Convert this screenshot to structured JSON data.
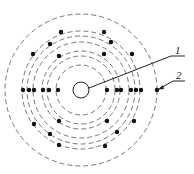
{
  "diagram": {
    "type": "atom-shell-model",
    "center": {
      "x": 81,
      "y": 90
    },
    "nucleus_radius": 8,
    "ring_radii": [
      25,
      34,
      39,
      48,
      54,
      59,
      76
    ],
    "electrons": [
      {
        "x": 23,
        "y": 90
      },
      {
        "x": 29,
        "y": 90
      },
      {
        "x": 34,
        "y": 90
      },
      {
        "x": 43,
        "y": 90
      },
      {
        "x": 49,
        "y": 90
      },
      {
        "x": 58,
        "y": 90
      },
      {
        "x": 107,
        "y": 90
      },
      {
        "x": 117,
        "y": 90
      },
      {
        "x": 121,
        "y": 90
      },
      {
        "x": 131,
        "y": 90
      },
      {
        "x": 136,
        "y": 90
      },
      {
        "x": 141,
        "y": 90
      },
      {
        "x": 157,
        "y": 90
      },
      {
        "x": 61,
        "y": 32
      },
      {
        "x": 104,
        "y": 32
      },
      {
        "x": 50,
        "y": 44
      },
      {
        "x": 111,
        "y": 42
      },
      {
        "x": 33,
        "y": 54
      },
      {
        "x": 59,
        "y": 56
      },
      {
        "x": 104,
        "y": 54
      },
      {
        "x": 132,
        "y": 54
      },
      {
        "x": 34,
        "y": 124
      },
      {
        "x": 59,
        "y": 121
      },
      {
        "x": 50,
        "y": 134
      },
      {
        "x": 59,
        "y": 145
      },
      {
        "x": 107,
        "y": 121
      },
      {
        "x": 134,
        "y": 121
      },
      {
        "x": 117,
        "y": 132
      },
      {
        "x": 105,
        "y": 146
      }
    ],
    "labels": [
      {
        "text": "1",
        "target": "nucleus"
      },
      {
        "text": "2",
        "target": "outer-electron"
      }
    ],
    "colors": {
      "line": "#222222",
      "ring": "#555555",
      "background": "#ffffff"
    }
  }
}
